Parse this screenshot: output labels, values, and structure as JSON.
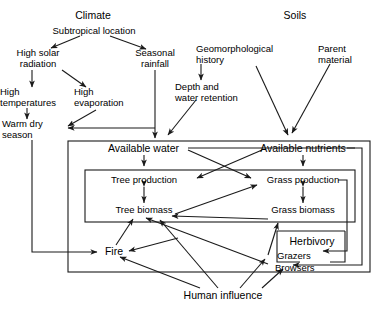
{
  "figure": {
    "type": "flow-diagram",
    "background": "#ffffff",
    "line_color": "#1a1a1a",
    "text_color": "#000000"
  },
  "headings": {
    "climate": "Climate",
    "soils": "Soils"
  },
  "nodes": {
    "subtropical_location": "Subtropical location",
    "high_solar_radiation": "High solar\nradiation",
    "seasonal_rainfall": "Seasonal\nrainfall",
    "high_temperatures": "High\ntemperatures",
    "high_evaporation": "High\nevaporation",
    "warm_dry_season": "Warm dry\nseason",
    "geomorphological_history": "Geomorphological\nhistory",
    "parent_material": "Parent\nmaterial",
    "depth_and_water_retention": "Depth and\nwater retention",
    "available_water": "Available water",
    "available_nutrients": "Available nutrients",
    "tree_production": "Tree production",
    "grass_production": "Grass production",
    "tree_biomass": "Tree biomass",
    "grass_biomass": "Grass biomass",
    "fire": "Fire",
    "herbivory": "Herbivory",
    "grazers": "Grazers",
    "browsers": "Browsers",
    "human_influence": "Human influence"
  },
  "boxes": {
    "ecosystem_box": "outer ecosystem boundary",
    "production_box": "production and biomass boundary",
    "herbivory_box": "herbivory boundary"
  },
  "links": [
    {
      "from": "subtropical_location",
      "to": "high_solar_radiation"
    },
    {
      "from": "subtropical_location",
      "to": "seasonal_rainfall"
    },
    {
      "from": "high_solar_radiation",
      "to": "high_temperatures"
    },
    {
      "from": "high_solar_radiation",
      "to": "high_evaporation"
    },
    {
      "from": "high_temperatures",
      "to": "warm_dry_season"
    },
    {
      "from": "high_evaporation",
      "to": "warm_dry_season"
    },
    {
      "from": "seasonal_rainfall",
      "to": "warm_dry_season"
    },
    {
      "from": "seasonal_rainfall",
      "to": "available_water"
    },
    {
      "from": "geomorphological_history",
      "to": "depth_and_water_retention"
    },
    {
      "from": "geomorphological_history",
      "to": "available_nutrients"
    },
    {
      "from": "parent_material",
      "to": "available_nutrients"
    },
    {
      "from": "depth_and_water_retention",
      "to": "available_water"
    },
    {
      "from": "available_water",
      "to": "tree_production"
    },
    {
      "from": "available_water",
      "to": "grass_production"
    },
    {
      "from": "available_nutrients",
      "to": "grass_production"
    },
    {
      "from": "available_nutrients",
      "to": "tree_production"
    },
    {
      "from": "tree_production",
      "to": "tree_biomass",
      "style": "double"
    },
    {
      "from": "grass_production",
      "to": "grass_biomass",
      "style": "double"
    },
    {
      "from": "tree_biomass",
      "to": "grass_production"
    },
    {
      "from": "grass_production",
      "to": "grazers"
    },
    {
      "from": "grass_biomass",
      "to": "tree_biomass"
    },
    {
      "from": "warm_dry_season",
      "to": "fire"
    },
    {
      "from": "fire",
      "to": "tree_biomass"
    },
    {
      "from": "grass_biomass",
      "to": "fire"
    },
    {
      "from": "browsers",
      "to": "tree_biomass"
    },
    {
      "from": "grazers",
      "to": "grass_biomass"
    },
    {
      "from": "human_influence",
      "to": "fire"
    },
    {
      "from": "human_influence",
      "to": "tree_biomass"
    },
    {
      "from": "human_influence",
      "to": "grazers"
    },
    {
      "from": "human_influence",
      "to": "browsers"
    }
  ]
}
